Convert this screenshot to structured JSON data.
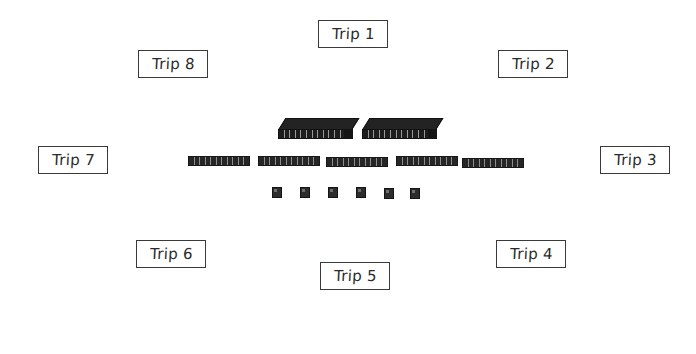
{
  "diagram": {
    "background_color": "#ffffff",
    "furniture_color": "#232323",
    "label_border_color": "#3a3a3a",
    "label_text_color": "#2b2b2b"
  },
  "trip_labels": [
    {
      "id": "trip-1",
      "text": "Trip 1",
      "x": 318,
      "y": 20,
      "w": 70,
      "h": 28
    },
    {
      "id": "trip-2",
      "text": "Trip 2",
      "x": 498,
      "y": 50,
      "w": 70,
      "h": 28
    },
    {
      "id": "trip-3",
      "text": "Trip 3",
      "x": 600,
      "y": 146,
      "w": 70,
      "h": 28
    },
    {
      "id": "trip-4",
      "text": "Trip 4",
      "x": 496,
      "y": 240,
      "w": 70,
      "h": 28
    },
    {
      "id": "trip-5",
      "text": "Trip 5",
      "x": 320,
      "y": 262,
      "w": 70,
      "h": 28
    },
    {
      "id": "trip-6",
      "text": "Trip 6",
      "x": 136,
      "y": 240,
      "w": 70,
      "h": 28
    },
    {
      "id": "trip-7",
      "text": "Trip 7",
      "x": 38,
      "y": 146,
      "w": 70,
      "h": 28
    },
    {
      "id": "trip-8",
      "text": "Trip 8",
      "x": 138,
      "y": 50,
      "w": 70,
      "h": 28
    }
  ],
  "platforms": [
    {
      "id": "platform-left",
      "x": 278,
      "y": 118,
      "w": 74,
      "h": 12,
      "segments": 13
    },
    {
      "id": "platform-right",
      "x": 362,
      "y": 118,
      "w": 74,
      "h": 12,
      "segments": 13
    }
  ],
  "benches": [
    {
      "id": "bench-1",
      "x": 188,
      "y": 156,
      "w": 62,
      "h": 10,
      "segments": 11
    },
    {
      "id": "bench-2",
      "x": 258,
      "y": 156,
      "w": 62,
      "h": 10,
      "segments": 11
    },
    {
      "id": "bench-3",
      "x": 326,
      "y": 157,
      "w": 62,
      "h": 10,
      "segments": 11
    },
    {
      "id": "bench-4",
      "x": 396,
      "y": 156,
      "w": 62,
      "h": 10,
      "segments": 11
    },
    {
      "id": "bench-5",
      "x": 462,
      "y": 158,
      "w": 62,
      "h": 10,
      "segments": 11
    }
  ],
  "stools": [
    {
      "id": "stool-1",
      "x": 272,
      "y": 187,
      "w": 10,
      "h": 11
    },
    {
      "id": "stool-2",
      "x": 300,
      "y": 187,
      "w": 10,
      "h": 11
    },
    {
      "id": "stool-3",
      "x": 328,
      "y": 187,
      "w": 10,
      "h": 11
    },
    {
      "id": "stool-4",
      "x": 356,
      "y": 187,
      "w": 10,
      "h": 11
    },
    {
      "id": "stool-5",
      "x": 384,
      "y": 188,
      "w": 10,
      "h": 11
    },
    {
      "id": "stool-6",
      "x": 410,
      "y": 188,
      "w": 10,
      "h": 11
    }
  ]
}
